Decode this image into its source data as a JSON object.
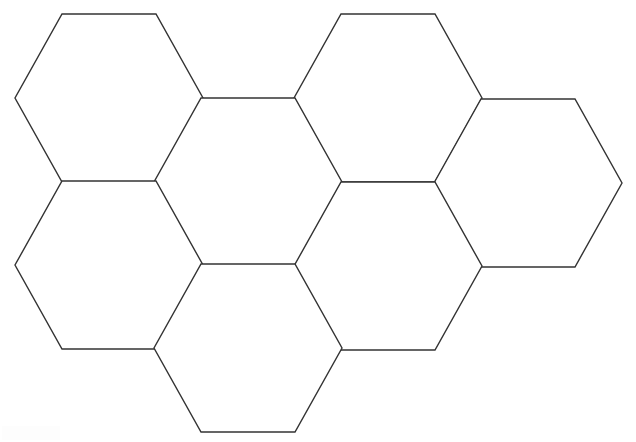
{
  "document": {
    "title": "Hexagon Tiling Worksheet",
    "kind": "line-drawing",
    "background_color": "#ffffff",
    "stroke_color": "#333333",
    "stroke_width": 1.4,
    "canvas": {
      "width": 636,
      "height": 442
    }
  },
  "figure": {
    "name": "honeycomb-hexagon-grid",
    "shape": "regular hexagon",
    "orientation": "flat-top",
    "count": 7,
    "geometry": {
      "half_width": 94,
      "half_height": 84,
      "flat_half_length": 47,
      "note": "Each hexagon has left and right point vertices; top and bottom edges are horizontal."
    },
    "rows": [
      {
        "label": "upper-row",
        "center_y": 98,
        "cells": 2
      },
      {
        "label": "middle-row",
        "center_y": 182,
        "cells": 2
      },
      {
        "label": "lower-row",
        "center_y": 265,
        "cells": 2
      },
      {
        "label": "bottom-row",
        "center_y": 348,
        "cells": 1
      }
    ],
    "cells": [
      {
        "id": "hex-1",
        "label": "upper-left",
        "cx": 109,
        "cy": 98
      },
      {
        "id": "hex-2",
        "label": "upper-right",
        "cx": 388,
        "cy": 98
      },
      {
        "id": "hex-3",
        "label": "middle-center",
        "cx": 248,
        "cy": 182
      },
      {
        "id": "hex-4",
        "label": "middle-right",
        "cx": 528,
        "cy": 183
      },
      {
        "id": "hex-5",
        "label": "lower-left",
        "cx": 109,
        "cy": 265
      },
      {
        "id": "hex-6",
        "label": "lower-right",
        "cx": 388,
        "cy": 266
      },
      {
        "id": "hex-7",
        "label": "bottom-center",
        "cx": 248,
        "cy": 348
      }
    ]
  }
}
